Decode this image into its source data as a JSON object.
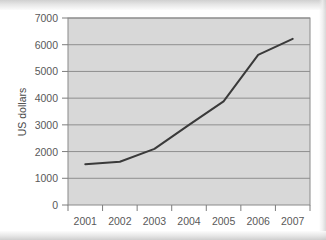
{
  "chart_data": {
    "type": "line",
    "title": "",
    "subtitle": "",
    "xlabel": "",
    "ylabel": "US dollars",
    "categories": [
      "2001",
      "2002",
      "2003",
      "2004",
      "2005",
      "2006",
      "2007"
    ],
    "x": [
      2001,
      2002,
      2003,
      2004,
      2005,
      2006,
      2007
    ],
    "series": [
      {
        "name": "US dollars",
        "values": [
          1530,
          1620,
          2100,
          3000,
          3880,
          5620,
          6220
        ],
        "color": "#3a3a3a"
      }
    ],
    "ylim": [
      0,
      7000
    ],
    "ytick_step": 1000,
    "y_ticks": [
      "0",
      "1000",
      "2000",
      "3000",
      "4000",
      "5000",
      "6000",
      "7000"
    ],
    "y_tick_values": [
      0,
      1000,
      2000,
      3000,
      4000,
      5000,
      6000,
      7000
    ],
    "x_ticks": [
      "2001",
      "2002",
      "2003",
      "2004",
      "2005",
      "2006",
      "2007"
    ],
    "grid": "horizontal",
    "legend": "none",
    "plot_background": "#d8d8d8",
    "plot_border": "#8a8a8a",
    "gridline_color": "#8e8e8e",
    "annotations": []
  },
  "axes": {
    "y_axis_title": "US dollars"
  }
}
